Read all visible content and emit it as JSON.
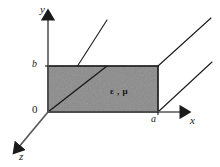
{
  "figure": {
    "type": "3d-coordinate-diagram",
    "background_color": "#ffffff",
    "line_color": "#1a1a1a",
    "fill_color": "#8a8a8a"
  },
  "axes": {
    "y": {
      "label": "y",
      "direction": "up"
    },
    "x": {
      "label": "x",
      "direction": "right"
    },
    "z": {
      "label": "z",
      "direction": "down-left"
    }
  },
  "ticks": {
    "origin": "0",
    "y_mark": "b",
    "x_mark": "a"
  },
  "region": {
    "material_label": "ε , μ",
    "shape": "rectangle",
    "width_symbol": "a",
    "height_symbol": "b"
  },
  "perspective_lines": {
    "count": 3,
    "note": "parallel receding edges drawn along the z direction"
  }
}
